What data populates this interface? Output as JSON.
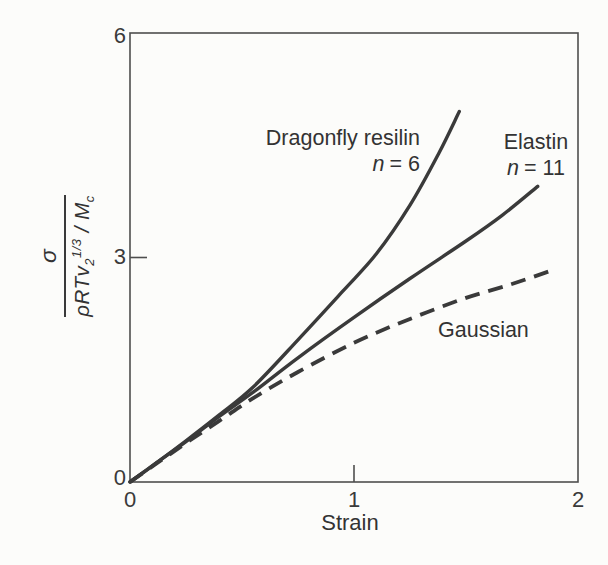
{
  "chart_data": {
    "type": "line",
    "title": "",
    "xlabel": "Strain",
    "ylabel_text": "σ / (ρRTv2^(1/3) / Mc)",
    "ylabel_parts": {
      "numerator": "σ",
      "den_base": "ρRTv",
      "den_sub": "2",
      "den_sup": "1/3",
      "den_sep": " / ",
      "den_m": "M",
      "den_msub": "c"
    },
    "xlim": [
      0,
      2
    ],
    "ylim": [
      0,
      6
    ],
    "xticks": [
      0,
      1,
      2
    ],
    "yticks": [
      0,
      3,
      6
    ],
    "xtick_labels": [
      "0",
      "1",
      "2"
    ],
    "ytick_labels": [
      "0",
      "3",
      "6"
    ],
    "grid": false,
    "legend_position": "inline-annotations",
    "series": [
      {
        "label": "Dragonfly resilin",
        "n_var": "n",
        "n_value": "= 6",
        "style": "solid",
        "points": [
          [
            0,
            0
          ],
          [
            0.12,
            0.26
          ],
          [
            0.25,
            0.55
          ],
          [
            0.4,
            0.9
          ],
          [
            0.55,
            1.27
          ],
          [
            0.75,
            1.9
          ],
          [
            0.95,
            2.55
          ],
          [
            1.1,
            3.05
          ],
          [
            1.25,
            3.7
          ],
          [
            1.38,
            4.4
          ],
          [
            1.47,
            4.95
          ]
        ]
      },
      {
        "label": "Elastin",
        "n_var": "n",
        "n_value": "= 11",
        "style": "solid",
        "points": [
          [
            0,
            0
          ],
          [
            0.12,
            0.26
          ],
          [
            0.25,
            0.54
          ],
          [
            0.4,
            0.88
          ],
          [
            0.55,
            1.2
          ],
          [
            0.75,
            1.66
          ],
          [
            1.0,
            2.2
          ],
          [
            1.25,
            2.72
          ],
          [
            1.5,
            3.22
          ],
          [
            1.66,
            3.56
          ],
          [
            1.82,
            3.95
          ]
        ]
      },
      {
        "label": "Gaussian",
        "style": "dashed",
        "points": [
          [
            0,
            0
          ],
          [
            0.12,
            0.25
          ],
          [
            0.25,
            0.52
          ],
          [
            0.4,
            0.82
          ],
          [
            0.55,
            1.12
          ],
          [
            0.75,
            1.47
          ],
          [
            1.0,
            1.86
          ],
          [
            1.25,
            2.18
          ],
          [
            1.5,
            2.46
          ],
          [
            1.7,
            2.64
          ],
          [
            1.875,
            2.82
          ]
        ]
      }
    ]
  }
}
